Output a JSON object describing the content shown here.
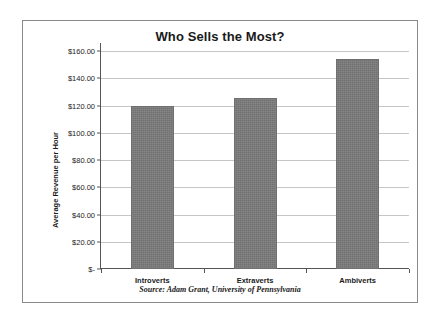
{
  "chart_data": {
    "type": "bar",
    "title": "Who Sells the Most?",
    "categories": [
      "Introverts",
      "Extraverts",
      "Ambiverts"
    ],
    "values": [
      120.0,
      125.5,
      154.5
    ],
    "xlabel": "",
    "ylabel": "Average Revenue per Hour",
    "ylim": [
      0,
      160
    ],
    "ytick_values": [
      160,
      140,
      120,
      100,
      80,
      60,
      40,
      20,
      0
    ],
    "ytick_labels": [
      "$160.00",
      "$140.00",
      "$120.00",
      "$100.00",
      "$80.00",
      "$60.00",
      "$40.00",
      "$20.00",
      "$-"
    ],
    "grid": true,
    "legend": false,
    "bar_color": "#7b7b7b",
    "gridline_color": "#c6c6c6",
    "axis_color": "#555555",
    "source_note": "Source: Adam Grant, University of Pennsylvania"
  }
}
